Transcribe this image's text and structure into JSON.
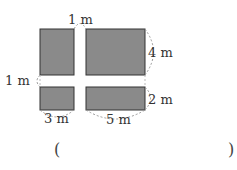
{
  "diagram": {
    "labels": {
      "top_road_width": "1 m",
      "right_upper_height": "4 m",
      "left_road_width": "1 m",
      "right_lower_height": "2 m",
      "bottom_left_width": "3 m",
      "bottom_right_width": "5 m"
    },
    "colors": {
      "fill": "#8a8a8a",
      "stroke": "#333333",
      "dash": "#999999"
    }
  },
  "answer": {
    "open_paren": "(",
    "close_paren": ")"
  }
}
